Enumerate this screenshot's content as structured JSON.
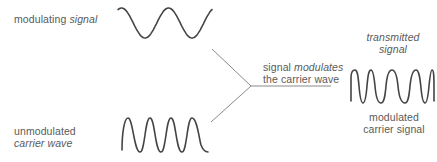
{
  "diagram": {
    "labels": {
      "modulating_signal": {
        "plain": "modulating ",
        "italic": "signal"
      },
      "unmodulated_carrier": {
        "line1": "unmodulated",
        "line2_italic": "carrier wave"
      },
      "modulates": {
        "line1_plain": "signal ",
        "line1_italic": "modulates",
        "line2": "the carrier wave"
      },
      "transmitted": {
        "line1_italic": "transmitted",
        "line2_italic": "signal"
      },
      "modulated_carrier": {
        "line1": "modulated",
        "line2": "carrier signal"
      }
    },
    "waves": {
      "modulating_signal": {
        "type": "sine",
        "cycles": 2,
        "x": [
          118,
          212
        ],
        "y": [
          8,
          38
        ]
      },
      "carrier_wave": {
        "type": "sine",
        "cycles": 4,
        "x": [
          122,
          208
        ],
        "y": [
          118,
          152
        ]
      },
      "transmitted_signal": {
        "type": "frequency-modulated",
        "peaks": 6,
        "x": [
          351,
          434
        ],
        "y": [
          70,
          103
        ]
      }
    },
    "connector": {
      "upper_start": [
        212,
        49
      ],
      "lower_start": [
        211,
        122
      ],
      "junction": [
        251,
        86
      ],
      "arrow_end": [
        331,
        86
      ]
    },
    "colors": {
      "text": "#5a5a5a",
      "wave": "#444444",
      "line": "#8a8a8a"
    }
  }
}
